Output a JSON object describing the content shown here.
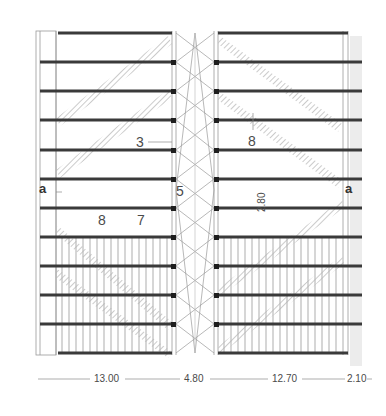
{
  "diagram": {
    "type": "structural roof plan",
    "labels": {
      "section_left": "a",
      "section_right": "a",
      "callout_3": "3",
      "callout_8_top": "8",
      "callout_5": "5",
      "callout_8_bottom": "8",
      "callout_7": "7",
      "spacing": "2.80"
    },
    "dimensions": [
      {
        "label": "13.00"
      },
      {
        "label": "4.80"
      },
      {
        "label": "12.70"
      },
      {
        "label": "2.10"
      }
    ],
    "beam_count": 12,
    "colors": {
      "beam": "#3a3a3a",
      "thin_line": "#9a9a9a",
      "brace_band": "#c8c8c8",
      "text": "#4a4a4a"
    }
  }
}
